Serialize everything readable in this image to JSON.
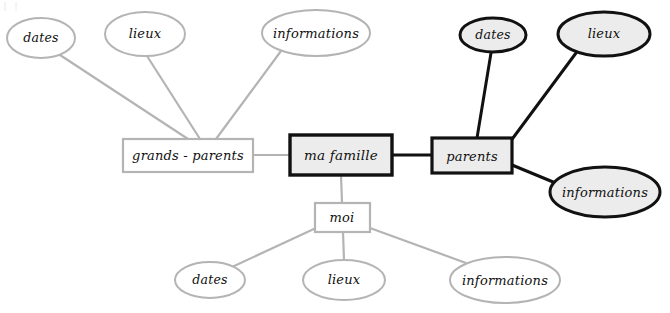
{
  "diagram": {
    "type": "mind-map",
    "title": "ma famille",
    "language": "fr",
    "canvas": {
      "width": 670,
      "height": 313,
      "background": "#ffffff"
    },
    "styles": {
      "faint_stroke": "#b4b4b4",
      "bold_stroke": "#111111",
      "faint_fill": "#ffffff",
      "bold_fill": "#ececec",
      "text_color": "#101010"
    },
    "center": {
      "id": "ma-famille",
      "label": "ma famille",
      "shape": "rect",
      "emphasis": "bold",
      "x": 341,
      "y": 155,
      "w": 102,
      "h": 40
    },
    "branches": [
      {
        "id": "grands-parents",
        "label": "grands - parents",
        "shape": "rect",
        "emphasis": "faint",
        "x": 188,
        "y": 155,
        "w": 130,
        "h": 33,
        "children": [
          {
            "id": "gp-dates",
            "label": "dates",
            "shape": "ellipse",
            "emphasis": "faint",
            "x": 41,
            "y": 38,
            "rx": 34,
            "ry": 20
          },
          {
            "id": "gp-lieux",
            "label": "lieux",
            "shape": "ellipse",
            "emphasis": "faint",
            "x": 145,
            "y": 34,
            "rx": 40,
            "ry": 22
          },
          {
            "id": "gp-informations",
            "label": "informations",
            "shape": "ellipse",
            "emphasis": "faint",
            "x": 316,
            "y": 33,
            "rx": 54,
            "ry": 23
          }
        ]
      },
      {
        "id": "parents",
        "label": "parents",
        "shape": "rect",
        "emphasis": "bold",
        "x": 472,
        "y": 156,
        "w": 80,
        "h": 35,
        "children": [
          {
            "id": "p-dates",
            "label": "dates",
            "shape": "ellipse",
            "emphasis": "bold",
            "x": 493,
            "y": 35,
            "rx": 33,
            "ry": 17
          },
          {
            "id": "p-lieux",
            "label": "lieux",
            "shape": "ellipse",
            "emphasis": "bold",
            "x": 604,
            "y": 34,
            "rx": 46,
            "ry": 22
          },
          {
            "id": "p-informations",
            "label": "informations",
            "shape": "ellipse",
            "emphasis": "bold",
            "x": 605,
            "y": 192,
            "rx": 55,
            "ry": 25
          }
        ]
      },
      {
        "id": "moi",
        "label": "moi",
        "shape": "rect",
        "emphasis": "faint",
        "x": 342,
        "y": 217,
        "w": 55,
        "h": 29,
        "children": [
          {
            "id": "m-dates",
            "label": "dates",
            "shape": "ellipse",
            "emphasis": "faint",
            "x": 210,
            "y": 280,
            "rx": 35,
            "ry": 18
          },
          {
            "id": "m-lieux",
            "label": "lieux",
            "shape": "ellipse",
            "emphasis": "faint",
            "x": 344,
            "y": 280,
            "rx": 41,
            "ry": 20
          },
          {
            "id": "m-informations",
            "label": "informations",
            "shape": "ellipse",
            "emphasis": "faint",
            "x": 505,
            "y": 280,
            "rx": 55,
            "ry": 23
          }
        ]
      }
    ],
    "edges": [
      {
        "from": "ma-famille",
        "to": "grands-parents",
        "emphasis": "faint"
      },
      {
        "from": "ma-famille",
        "to": "parents",
        "emphasis": "bold"
      },
      {
        "from": "ma-famille",
        "to": "moi",
        "emphasis": "faint"
      },
      {
        "from": "grands-parents",
        "to": "gp-dates",
        "emphasis": "faint"
      },
      {
        "from": "grands-parents",
        "to": "gp-lieux",
        "emphasis": "faint"
      },
      {
        "from": "grands-parents",
        "to": "gp-informations",
        "emphasis": "faint"
      },
      {
        "from": "parents",
        "to": "p-dates",
        "emphasis": "bold"
      },
      {
        "from": "parents",
        "to": "p-lieux",
        "emphasis": "bold"
      },
      {
        "from": "parents",
        "to": "p-informations",
        "emphasis": "bold"
      },
      {
        "from": "moi",
        "to": "m-dates",
        "emphasis": "faint"
      },
      {
        "from": "moi",
        "to": "m-lieux",
        "emphasis": "faint"
      },
      {
        "from": "moi",
        "to": "m-informations",
        "emphasis": "faint"
      }
    ]
  }
}
